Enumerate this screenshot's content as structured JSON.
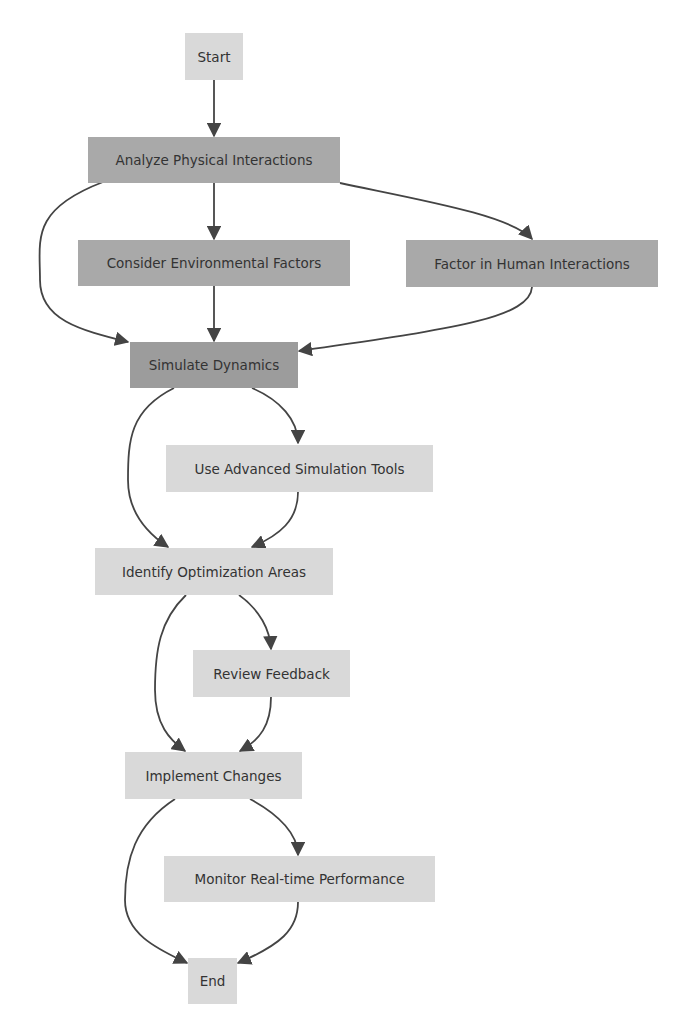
{
  "diagram": {
    "type": "flowchart",
    "nodes": {
      "start": {
        "label": "Start",
        "shade": "light"
      },
      "analyze": {
        "label": "Analyze Physical Interactions",
        "shade": "dark"
      },
      "consider": {
        "label": "Consider Environmental Factors",
        "shade": "dark"
      },
      "factor": {
        "label": "Factor in Human Interactions",
        "shade": "dark"
      },
      "simulate": {
        "label": "Simulate Dynamics",
        "shade": "darker"
      },
      "tools": {
        "label": "Use Advanced Simulation Tools",
        "shade": "light"
      },
      "identify": {
        "label": "Identify Optimization Areas",
        "shade": "light"
      },
      "review": {
        "label": "Review Feedback",
        "shade": "light"
      },
      "implement": {
        "label": "Implement Changes",
        "shade": "light"
      },
      "monitor": {
        "label": "Monitor Real-time Performance",
        "shade": "light"
      },
      "end": {
        "label": "End",
        "shade": "light"
      }
    },
    "edges": [
      [
        "start",
        "analyze"
      ],
      [
        "analyze",
        "consider"
      ],
      [
        "analyze",
        "factor"
      ],
      [
        "analyze",
        "simulate"
      ],
      [
        "consider",
        "simulate"
      ],
      [
        "factor",
        "simulate"
      ],
      [
        "simulate",
        "tools"
      ],
      [
        "simulate",
        "identify"
      ],
      [
        "tools",
        "identify"
      ],
      [
        "identify",
        "review"
      ],
      [
        "identify",
        "implement"
      ],
      [
        "review",
        "implement"
      ],
      [
        "implement",
        "monitor"
      ],
      [
        "implement",
        "end"
      ],
      [
        "monitor",
        "end"
      ]
    ],
    "colors": {
      "dark_node": "#a9a9a9",
      "darker_node": "#9c9c9c",
      "light_node": "#d9d9d9",
      "edge": "#444444"
    }
  }
}
